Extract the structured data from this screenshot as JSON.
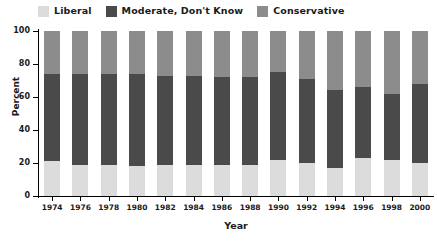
{
  "chart_data": {
    "type": "bar",
    "stacked": true,
    "stack_mode": "percent",
    "title": "",
    "xlabel": "Year",
    "ylabel": "Percent",
    "ylim": [
      0,
      100
    ],
    "yticks": [
      0,
      20,
      40,
      60,
      80,
      100
    ],
    "grid": false,
    "legend_position": "top-left",
    "categories": [
      "1974",
      "1976",
      "1978",
      "1980",
      "1982",
      "1984",
      "1986",
      "1988",
      "1990",
      "1992",
      "1994",
      "1996",
      "1998",
      "2000"
    ],
    "series": [
      {
        "name": "Liberal",
        "color": "#dcdcdc",
        "values": [
          21,
          19,
          19,
          18,
          19,
          19,
          19,
          19,
          22,
          20,
          17,
          23,
          22,
          20
        ]
      },
      {
        "name": "Moderate, Don't Know",
        "color": "#4a4a4a",
        "values": [
          53,
          55,
          55,
          56,
          54,
          54,
          53,
          53,
          53,
          51,
          47,
          43,
          40,
          48
        ]
      },
      {
        "name": "Conservative",
        "color": "#8c8c8c",
        "values": [
          26,
          26,
          26,
          26,
          27,
          27,
          28,
          28,
          25,
          29,
          36,
          34,
          38,
          32
        ]
      }
    ]
  },
  "legend": {
    "items": [
      {
        "label": "Liberal",
        "color": "#dcdcdc"
      },
      {
        "label": "Moderate, Don't Know",
        "color": "#4a4a4a"
      },
      {
        "label": "Conservative",
        "color": "#8c8c8c"
      }
    ]
  },
  "axes": {
    "y_title": "Percent",
    "x_title": "Year",
    "y_tick_labels": [
      "0",
      "20",
      "40",
      "60",
      "80",
      "100"
    ],
    "x_tick_labels": [
      "1974",
      "1976",
      "1978",
      "1980",
      "1982",
      "1984",
      "1986",
      "1988",
      "1990",
      "1992",
      "1994",
      "1996",
      "1998",
      "2000"
    ]
  }
}
